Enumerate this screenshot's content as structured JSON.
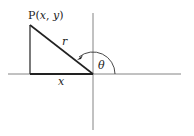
{
  "diagram": {
    "type": "polar-coordinate-triangle",
    "point_label": {
      "prefix": "P",
      "open": "(",
      "x": "x",
      "sep": ", ",
      "y": "y",
      "close": ")"
    },
    "hypotenuse_label": "r",
    "base_label": "x",
    "angle_label": "θ",
    "colors": {
      "stroke": "#222222",
      "axis": "#555555",
      "background": "#ffffff"
    }
  }
}
